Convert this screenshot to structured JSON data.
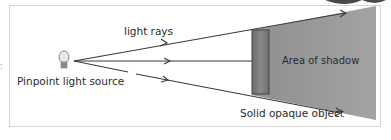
{
  "diagram": {
    "title_hint": "Shadow formation from a pinpoint light source",
    "labels": {
      "light_rays": "light rays",
      "light_source": "Pinpoint light source",
      "shadow_area": "Area of shadow",
      "object": "Solid opaque object"
    },
    "icons": {
      "light_source": "light-bulb-icon"
    },
    "colors": {
      "shadow": "#9a9a9a",
      "object_fill": "#7a7a7a",
      "ray_line": "#3a3a3a",
      "frame_border": "#d4d4d4"
    },
    "rays": [
      {
        "name": "upper-ray",
        "direction": "diverging-up"
      },
      {
        "name": "middle-ray",
        "direction": "horizontal"
      },
      {
        "name": "lower-ray",
        "direction": "diverging-down"
      }
    ]
  }
}
